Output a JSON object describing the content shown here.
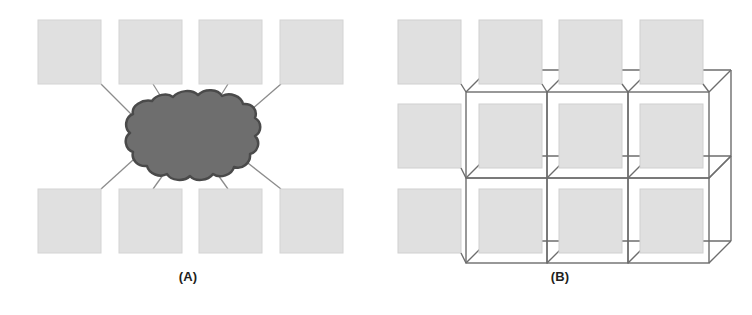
{
  "figure": {
    "title": "",
    "background_color": "#ffffff",
    "width": 752,
    "height": 315
  },
  "colors": {
    "node_fill": "#e0e0e0",
    "node_stroke": "#cfcfcf",
    "cloud_fill": "#6e6e6e",
    "cloud_stroke": "#4a4a4a",
    "link_stroke": "#8c8c8c",
    "box_stroke": "#6d6d6d",
    "caption_text": "#231f20"
  },
  "panels": [
    {
      "id": "A",
      "caption": "(A)",
      "topology": "star",
      "description": "Eight peripheral nodes connected by links to a central cloud",
      "center": {
        "name": "cloud",
        "shape": "cloud",
        "cx": 186,
        "cy": 137,
        "rx": 69,
        "ry": 43
      },
      "nodes": [
        {
          "index": 1,
          "row": "top",
          "x": 38,
          "y": 20,
          "w": 63,
          "h": 64
        },
        {
          "index": 2,
          "row": "top",
          "x": 119,
          "y": 20,
          "w": 63,
          "h": 64
        },
        {
          "index": 3,
          "row": "top",
          "x": 199,
          "y": 20,
          "w": 63,
          "h": 64
        },
        {
          "index": 4,
          "row": "top",
          "x": 280,
          "y": 20,
          "w": 63,
          "h": 64
        },
        {
          "index": 5,
          "row": "bottom",
          "x": 38,
          "y": 189,
          "w": 63,
          "h": 64
        },
        {
          "index": 6,
          "row": "bottom",
          "x": 119,
          "y": 189,
          "w": 63,
          "h": 64
        },
        {
          "index": 7,
          "row": "bottom",
          "x": 199,
          "y": 189,
          "w": 63,
          "h": 64
        },
        {
          "index": 8,
          "row": "bottom",
          "x": 280,
          "y": 189,
          "w": 63,
          "h": 64
        }
      ],
      "links": [
        {
          "from": "node-1",
          "to": "cloud",
          "x1": 101,
          "y1": 84,
          "x2": 133,
          "y2": 116
        },
        {
          "from": "node-2",
          "to": "cloud",
          "x1": 153,
          "y1": 84,
          "x2": 163,
          "y2": 99
        },
        {
          "from": "node-3",
          "to": "cloud",
          "x1": 228,
          "y1": 84,
          "x2": 218,
          "y2": 99
        },
        {
          "from": "node-4",
          "to": "cloud",
          "x1": 280,
          "y1": 84,
          "x2": 245,
          "y2": 115
        },
        {
          "from": "node-5",
          "to": "cloud",
          "x1": 101,
          "y1": 189,
          "x2": 133,
          "y2": 160
        },
        {
          "from": "node-6",
          "to": "cloud",
          "x1": 153,
          "y1": 189,
          "x2": 163,
          "y2": 176
        },
        {
          "from": "node-7",
          "to": "cloud",
          "x1": 228,
          "y1": 189,
          "x2": 218,
          "y2": 176
        },
        {
          "from": "node-8",
          "to": "cloud",
          "x1": 280,
          "y1": 189,
          "x2": 245,
          "y2": 160
        }
      ]
    },
    {
      "id": "B",
      "caption": "(B)",
      "topology": "mesh-grid",
      "description": "A four-by-three arrangement of nodes wired as a 3D isometric mesh grid",
      "grid": {
        "columns": 4,
        "rows": 3,
        "node_w": 63,
        "node_h": 64,
        "col_x": [
          398,
          479,
          559,
          640
        ],
        "row_y": [
          20,
          104,
          189
        ],
        "depth_dx": 22,
        "depth_dy": -22
      },
      "nodes": [
        {
          "index": 1,
          "row": 1,
          "col": 1,
          "x": 398,
          "y": 20,
          "w": 63,
          "h": 64,
          "boxed": false
        },
        {
          "index": 2,
          "row": 1,
          "col": 2,
          "x": 479,
          "y": 20,
          "w": 63,
          "h": 64,
          "boxed": false
        },
        {
          "index": 3,
          "row": 1,
          "col": 3,
          "x": 559,
          "y": 20,
          "w": 63,
          "h": 64,
          "boxed": false
        },
        {
          "index": 4,
          "row": 1,
          "col": 4,
          "x": 640,
          "y": 20,
          "w": 63,
          "h": 64,
          "boxed": false
        },
        {
          "index": 5,
          "row": 2,
          "col": 1,
          "x": 398,
          "y": 104,
          "w": 63,
          "h": 64,
          "boxed": false
        },
        {
          "index": 6,
          "row": 2,
          "col": 2,
          "x": 479,
          "y": 104,
          "w": 63,
          "h": 64,
          "boxed": true
        },
        {
          "index": 7,
          "row": 2,
          "col": 3,
          "x": 559,
          "y": 104,
          "w": 63,
          "h": 64,
          "boxed": true
        },
        {
          "index": 8,
          "row": 2,
          "col": 4,
          "x": 640,
          "y": 104,
          "w": 63,
          "h": 64,
          "boxed": true
        },
        {
          "index": 9,
          "row": 3,
          "col": 1,
          "x": 398,
          "y": 189,
          "w": 63,
          "h": 64,
          "boxed": false
        },
        {
          "index": 10,
          "row": 3,
          "col": 2,
          "x": 479,
          "y": 189,
          "w": 63,
          "h": 64,
          "boxed": true
        },
        {
          "index": 11,
          "row": 3,
          "col": 3,
          "x": 559,
          "y": 189,
          "w": 63,
          "h": 64,
          "boxed": true
        },
        {
          "index": 12,
          "row": 3,
          "col": 4,
          "x": 640,
          "y": 189,
          "w": 63,
          "h": 64,
          "boxed": true
        }
      ]
    }
  ]
}
